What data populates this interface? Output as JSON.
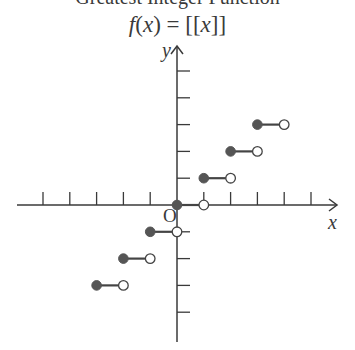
{
  "chart_data": {
    "type": "line",
    "title": "f(x) = [[x]]",
    "title_parts": {
      "fn": "f",
      "arg": "x",
      "eq": " = ",
      "open": "[[",
      "var": "x",
      "close": "]]"
    },
    "top_cut_text": "Greatest Integer Function",
    "xlabel": "x",
    "ylabel": "y",
    "origin_label": "O",
    "xlim": [
      -6,
      6
    ],
    "ylim": [
      -4,
      5
    ],
    "x_ticks": [
      -5,
      -4,
      -3,
      -2,
      -1,
      1,
      2,
      3,
      4,
      5
    ],
    "y_ticks": [
      -4,
      -3,
      -2,
      -1,
      1,
      2,
      3,
      4,
      5
    ],
    "grid": false,
    "series": [
      {
        "name": "f(x) = [[x]]",
        "style": "step",
        "segments": [
          {
            "x_start": -3,
            "x_end": -2,
            "y": -3,
            "start": "closed",
            "end": "open"
          },
          {
            "x_start": -2,
            "x_end": -1,
            "y": -2,
            "start": "closed",
            "end": "open"
          },
          {
            "x_start": -1,
            "x_end": 0,
            "y": -1,
            "start": "closed",
            "end": "open"
          },
          {
            "x_start": 0,
            "x_end": 1,
            "y": 0,
            "start": "closed",
            "end": "open"
          },
          {
            "x_start": 1,
            "x_end": 2,
            "y": 1,
            "start": "closed",
            "end": "open"
          },
          {
            "x_start": 2,
            "x_end": 3,
            "y": 2,
            "start": "closed",
            "end": "open"
          },
          {
            "x_start": 3,
            "x_end": 4,
            "y": 3,
            "start": "closed",
            "end": "open"
          }
        ]
      }
    ],
    "colors": {
      "axis": "#3a3a3a",
      "filled_dot": "#555555",
      "open_dot_fill": "#ffffff"
    }
  }
}
